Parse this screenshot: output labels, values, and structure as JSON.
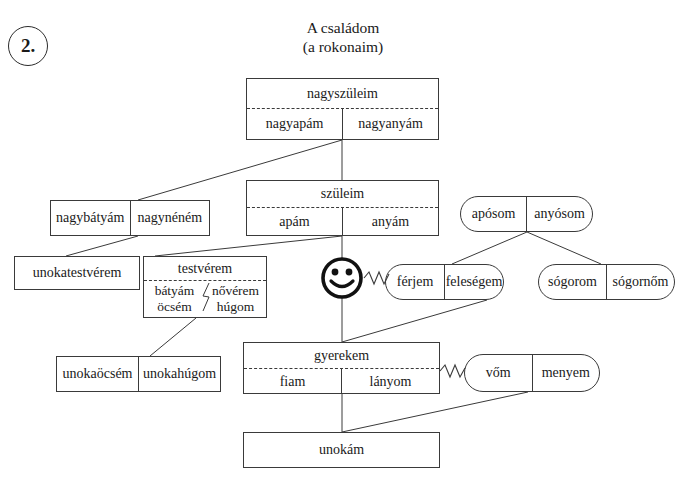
{
  "exercise": {
    "number": "2."
  },
  "title": {
    "line1": "A családom",
    "line2": "(a rokonaim)"
  },
  "colors": {
    "line": "#3a3a3a",
    "text": "#1a1a1a",
    "background": "#ffffff"
  },
  "nodes": {
    "grandparents": {
      "header": "nagyszüleim",
      "left": "nagyapám",
      "right": "nagyanyám"
    },
    "parents": {
      "header": "szüleim",
      "left": "apám",
      "right": "anyám"
    },
    "uncle_aunt": {
      "left": "nagybátyám",
      "right": "nagynéném"
    },
    "cousin": {
      "label": "unokatestvérem"
    },
    "sibling": {
      "header": "testvérem",
      "left_top": "bátyám",
      "left_bottom": "öcsém",
      "right_top": "nővérem",
      "right_bottom": "húgom"
    },
    "self": {
      "icon": "smiley-face-icon"
    },
    "spouse": {
      "left": "férjem",
      "right": "feleségem"
    },
    "parents_in_law": {
      "left": "apósom",
      "right": "anyósom"
    },
    "siblings_in_law": {
      "left": "sógorom",
      "right": "sógornőm"
    },
    "nephew_niece": {
      "left": "unokaöcsém",
      "right": "unokahúgom"
    },
    "child": {
      "header": "gyerekem",
      "left": "fiam",
      "right": "lányom"
    },
    "child_in_law": {
      "left": "vőm",
      "right": "menyem"
    },
    "grandchild": {
      "label": "unokám"
    }
  }
}
